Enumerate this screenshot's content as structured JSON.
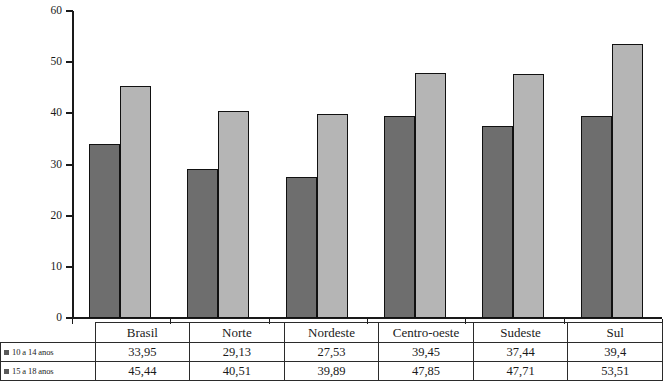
{
  "chart_data": {
    "type": "bar",
    "title": "",
    "subtitle": "",
    "xlabel": "",
    "ylabel": "",
    "ylim": [
      0,
      60
    ],
    "yticks": [
      0,
      10,
      20,
      30,
      40,
      50,
      60
    ],
    "ytick_labels": [
      "0",
      "10",
      "20",
      "30",
      "40",
      "50",
      "60"
    ],
    "grid": false,
    "legend_position": "table-left-column",
    "categories": [
      "Brasil",
      "Norte",
      "Nordeste",
      "Centro-oeste",
      "Sudeste",
      "Sul"
    ],
    "series": [
      {
        "name": "10 a 14 anos",
        "color": "#6e6e6e",
        "values": [
          33.95,
          29.13,
          27.53,
          39.45,
          37.44,
          39.4
        ],
        "labels": [
          "33,95",
          "29,13",
          "27,53",
          "39,45",
          "37,44",
          "39,4"
        ]
      },
      {
        "name": "15 a 18 anos",
        "color": "#b5b5b5",
        "values": [
          45.44,
          40.51,
          39.89,
          47.85,
          47.71,
          53.51
        ],
        "labels": [
          "45,44",
          "40,51",
          "39,89",
          "47,85",
          "47,71",
          "53,51"
        ]
      }
    ]
  },
  "table": {
    "legend_swatch_icon": "square-swatch-icon",
    "category_header_blank": ""
  },
  "caption": {
    "text": ""
  }
}
